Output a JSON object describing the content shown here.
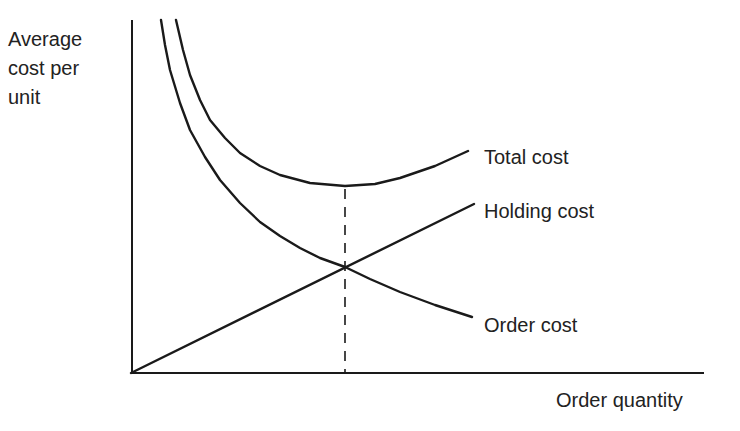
{
  "chart_data": {
    "type": "line",
    "title": "",
    "ylabel": [
      "Average",
      "cost per",
      "unit"
    ],
    "xlabel": "Order quantity",
    "grid": false,
    "legend": "inline labels at curve ends",
    "series": [
      {
        "name": "Total cost",
        "shape": "U-shaped curve (sum of order and holding cost), minimum above the crossover point",
        "points_px": [
          [
            176,
            20
          ],
          [
            183,
            50
          ],
          [
            190,
            75
          ],
          [
            200,
            100
          ],
          [
            210,
            120
          ],
          [
            225,
            138
          ],
          [
            240,
            153
          ],
          [
            260,
            166
          ],
          [
            280,
            175
          ],
          [
            310,
            183
          ],
          [
            345,
            186
          ],
          [
            375,
            184
          ],
          [
            400,
            178
          ],
          [
            435,
            166
          ],
          [
            468,
            151
          ]
        ]
      },
      {
        "name": "Holding cost",
        "shape": "straight line rising from origin",
        "points_px": [
          [
            131,
            373
          ],
          [
            474,
            204
          ]
        ]
      },
      {
        "name": "Order cost",
        "shape": "decreasing hyperbola",
        "points_px": [
          [
            161,
            20
          ],
          [
            165,
            45
          ],
          [
            170,
            70
          ],
          [
            180,
            103
          ],
          [
            190,
            130
          ],
          [
            205,
            157
          ],
          [
            220,
            180
          ],
          [
            240,
            203
          ],
          [
            260,
            222
          ],
          [
            280,
            236
          ],
          [
            300,
            248
          ],
          [
            320,
            258
          ],
          [
            345,
            267
          ],
          [
            370,
            279
          ],
          [
            400,
            292
          ],
          [
            435,
            305
          ],
          [
            472,
            317
          ]
        ]
      }
    ],
    "annotations": [
      {
        "type": "dashed-vertical-line",
        "label": "",
        "x_px": 345,
        "from_y_px": 188,
        "to_y_px": 373,
        "meaning": "optimal order quantity (total cost minimum / holding = order crossover)"
      }
    ],
    "axes": {
      "origin_px": [
        131,
        373
      ],
      "x_end_px": 704,
      "y_top_px": 20,
      "ticks": "none"
    }
  },
  "labels": {
    "y_axis_line1": "Average",
    "y_axis_line2": "cost per",
    "y_axis_line3": "unit",
    "x_axis": "Order quantity",
    "total_cost": "Total cost",
    "holding_cost": "Holding cost",
    "order_cost": "Order cost"
  },
  "colors": {
    "stroke": "#1a1a1a",
    "text": "#222222",
    "background": "#ffffff"
  }
}
